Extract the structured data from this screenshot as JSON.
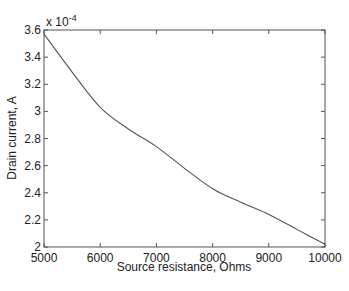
{
  "chart_data": {
    "type": "line",
    "title": "",
    "xlabel": "Source resistance, Ohms",
    "ylabel": "Drain current, A",
    "y_multiplier": "x 10",
    "y_multiplier_exp": "-4",
    "xlim": [
      5000,
      10000
    ],
    "ylim": [
      2.0,
      3.6
    ],
    "grid": false,
    "legend": null,
    "x_ticks": [
      "5000",
      "6000",
      "7000",
      "8000",
      "9000",
      "10000"
    ],
    "y_ticks": [
      "2",
      "2.2",
      "2.4",
      "2.6",
      "2.8",
      "3",
      "3.2",
      "3.4",
      "3.6"
    ],
    "series": [
      {
        "name": "Drain current",
        "x": [
          5000,
          5500,
          6000,
          6500,
          7000,
          7500,
          8000,
          8500,
          9000,
          9500,
          10000
        ],
        "values": [
          3.57,
          3.29,
          3.03,
          2.87,
          2.74,
          2.58,
          2.43,
          2.33,
          2.24,
          2.13,
          2.02
        ],
        "units": "x 10^-4 A"
      }
    ]
  }
}
